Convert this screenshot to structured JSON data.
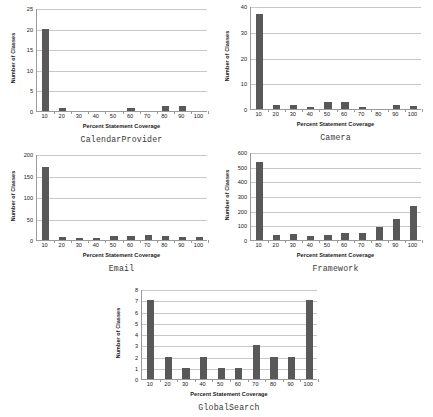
{
  "figure": {
    "background": "#ffffff",
    "bar_color": "#595959",
    "axis_color": "#9a9a9a",
    "gridline_color": "#c8c8c8"
  },
  "chart_data": [
    {
      "type": "bar",
      "id": "calendarprovider",
      "title": "CalendarProvider",
      "xlabel": "Percent Statement Coverage",
      "ylabel": "Number of Classes",
      "categories": [
        "10",
        "20",
        "30",
        "40",
        "50",
        "60",
        "70",
        "80",
        "90",
        "100"
      ],
      "values": [
        20,
        0.7,
        0,
        0,
        0,
        0.7,
        0,
        1.1,
        1.1,
        0
      ],
      "ylim": [
        0,
        25
      ],
      "yticks": [
        0,
        5,
        10,
        15,
        20,
        25
      ],
      "grid": true,
      "legend": "none"
    },
    {
      "type": "bar",
      "id": "camera",
      "title": "Camera",
      "xlabel": "Percent Statement Coverage",
      "ylabel": "Number of Classes",
      "categories": [
        "10",
        "20",
        "30",
        "40",
        "50",
        "60",
        "70",
        "80",
        "90",
        "100"
      ],
      "values": [
        37,
        1.5,
        1.5,
        0.7,
        2.6,
        2.6,
        0.6,
        0,
        1.5,
        1.3
      ],
      "ylim": [
        0,
        40
      ],
      "yticks": [
        0,
        10,
        20,
        30,
        40
      ],
      "grid": true,
      "legend": "none"
    },
    {
      "type": "bar",
      "id": "email",
      "title": "Email",
      "xlabel": "Percent Statement Coverage",
      "ylabel": "Number of Classes",
      "categories": [
        "10",
        "20",
        "30",
        "40",
        "50",
        "60",
        "70",
        "80",
        "90",
        "100"
      ],
      "values": [
        170,
        8,
        4,
        4,
        9,
        9,
        12,
        10,
        6,
        6
      ],
      "ylim": [
        0,
        200
      ],
      "yticks": [
        0,
        50,
        100,
        150,
        200
      ],
      "grid": true,
      "legend": "none"
    },
    {
      "type": "bar",
      "id": "framework",
      "title": "Framework",
      "xlabel": "Percent Statement Coverage",
      "ylabel": "Number of Classes",
      "categories": [
        "10",
        "20",
        "30",
        "40",
        "50",
        "60",
        "70",
        "80",
        "90",
        "100"
      ],
      "values": [
        535,
        35,
        42,
        25,
        33,
        45,
        45,
        90,
        140,
        232
      ],
      "ylim": [
        0,
        600
      ],
      "yticks": [
        0,
        100,
        200,
        300,
        400,
        500,
        600
      ],
      "grid": true,
      "legend": "none"
    },
    {
      "type": "bar",
      "id": "globalsearch",
      "title": "GlobalSearch",
      "xlabel": "Percent Statement Coverage",
      "ylabel": "Number of Classes",
      "categories": [
        "10",
        "20",
        "30",
        "40",
        "50",
        "60",
        "70",
        "80",
        "90",
        "100"
      ],
      "values": [
        7,
        2,
        1,
        2,
        1,
        1,
        3,
        2,
        2,
        7
      ],
      "ylim": [
        0,
        8
      ],
      "yticks": [
        0,
        1,
        2,
        3,
        4,
        5,
        6,
        7,
        8
      ],
      "grid": true,
      "legend": "none"
    }
  ],
  "layout": [
    {
      "id": "calendarprovider",
      "left": 8,
      "top": 4,
      "width": 205,
      "height": 143
    },
    {
      "id": "camera",
      "top": 2,
      "left": 222,
      "width": 205,
      "height": 143
    },
    {
      "id": "email",
      "left": 8,
      "top": 150,
      "width": 205,
      "height": 126
    },
    {
      "id": "framework",
      "left": 222,
      "top": 148,
      "width": 205,
      "height": 128
    },
    {
      "id": "globalsearch",
      "left": 113,
      "top": 285,
      "width": 210,
      "height": 130
    }
  ]
}
